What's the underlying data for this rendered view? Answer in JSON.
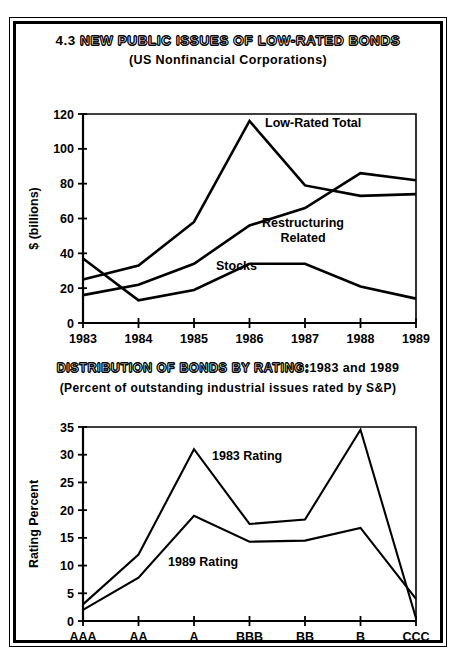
{
  "figure": {
    "number": "4.3",
    "upper_title": "NEW PUBLIC ISSUES OF LOW-RATED BONDS",
    "upper_subtitle": "(US Nonfinancial Corporations)",
    "lower_title": "DISTRIBUTION OF BONDS BY RATING:",
    "lower_title_years": "1983 and 1989",
    "lower_subtitle": "(Percent of outstanding industrial issues rated by S&P)",
    "line_color": "#000000",
    "background_color": "#ffffff"
  },
  "chart_data": [
    {
      "type": "line",
      "title": "4.3  NEW PUBLIC ISSUES OF LOW-RATED BONDS",
      "subtitle": "(US Nonfinancial Corporations)",
      "xlabel": "",
      "ylabel": "$ (billions)",
      "categories": [
        "1983",
        "1984",
        "1985",
        "1986",
        "1987",
        "1988",
        "1989"
      ],
      "x_ticks": [
        "1983",
        "1984",
        "1985",
        "1986",
        "1987",
        "1988",
        "1989"
      ],
      "y_ticks": [
        0,
        20,
        40,
        60,
        80,
        100,
        120
      ],
      "ylim": [
        0,
        120
      ],
      "grid": false,
      "legend_position": "inline-annotations",
      "series": [
        {
          "name": "Low-Rated Total",
          "values": [
            25,
            33,
            58,
            116,
            79,
            73,
            74
          ],
          "label_x": "1986",
          "label_text": "Low-Rated Total"
        },
        {
          "name": "Restructuring Related",
          "values": [
            16,
            22,
            34,
            56,
            66,
            86,
            82
          ],
          "label_x": "1987",
          "label_text": "Restructuring Related"
        },
        {
          "name": "Stocks",
          "values": [
            37,
            13,
            19,
            34,
            34,
            21,
            14
          ],
          "label_x": "1986",
          "label_text": "Stocks"
        }
      ]
    },
    {
      "type": "line",
      "title": "DISTRIBUTION OF BONDS BY RATING: 1983 and 1989",
      "subtitle": "(Percent of outstanding industrial issues rated by S&P)",
      "xlabel": "",
      "ylabel": "Rating Percent",
      "categories": [
        "AAA",
        "AA",
        "A",
        "BBB",
        "BB",
        "B",
        "CCC"
      ],
      "x_ticks": [
        "AAA",
        "AA",
        "A",
        "BBB",
        "BB",
        "B",
        "CCC"
      ],
      "y_ticks": [
        0,
        5,
        10,
        15,
        20,
        25,
        30,
        35
      ],
      "ylim": [
        0,
        35
      ],
      "grid": false,
      "legend_position": "inline-annotations",
      "series": [
        {
          "name": "1983 Rating",
          "values": [
            3.0,
            12.0,
            31.0,
            17.5,
            18.3,
            34.5,
            0.5
          ],
          "label_x": "A",
          "label_text": "1983 Rating"
        },
        {
          "name": "1989 Rating",
          "values": [
            2.0,
            7.8,
            19.0,
            14.3,
            14.5,
            16.8,
            4.0
          ],
          "label_x": "BBB",
          "label_text": "1989 Rating"
        }
      ]
    }
  ]
}
